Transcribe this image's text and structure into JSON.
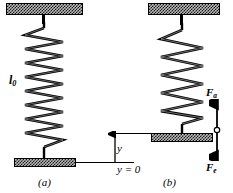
{
  "figure": {
    "panels": [
      {
        "id": "a",
        "caption": "(a)",
        "spring_label": "l",
        "spring_label_sub": "0",
        "coils": 14,
        "state": "relaxed"
      },
      {
        "id": "b",
        "caption": "(b)",
        "coils": 11,
        "state": "stretched"
      }
    ],
    "axis": {
      "displacement_label": "y",
      "origin_label": "y = 0"
    },
    "forces": [
      {
        "name": "force-up",
        "symbol": "F",
        "subscript": "a",
        "direction": "up"
      },
      {
        "name": "force-down",
        "symbol": "F",
        "subscript": "e",
        "direction": "down"
      }
    ],
    "colors": {
      "ink": "#000000",
      "hatch_fill": "#b9b9b9",
      "background": "#ffffff"
    }
  }
}
